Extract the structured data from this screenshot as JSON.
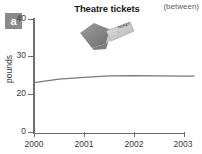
{
  "panel": {
    "letter": "a"
  },
  "header": {
    "title": "Theatre tickets",
    "note": "(between)"
  },
  "illustration": {
    "name": "theatre-tickets-photo",
    "ticket_text": "TICKET"
  },
  "chart_data": {
    "type": "line",
    "title": "Theatre tickets",
    "subtitle": "(between)",
    "xlabel": "",
    "ylabel": "pounds",
    "x": [
      2000,
      2000.5,
      2001,
      2001.5,
      2002,
      2002.5,
      2003,
      2003.2
    ],
    "values": [
      23.0,
      23.9,
      24.4,
      24.75,
      24.8,
      24.75,
      24.7,
      24.7
    ],
    "series": [
      {
        "name": "Theatre tickets",
        "values": [
          23.0,
          23.9,
          24.4,
          24.75,
          24.8,
          24.75,
          24.7,
          24.7
        ]
      }
    ],
    "x_tick_labels": [
      "2000",
      "2001",
      "2002",
      "2003"
    ],
    "x_tick_values": [
      2000,
      2001,
      2002,
      2003
    ],
    "y_tick_labels": [
      "40",
      "30",
      "20",
      "0"
    ],
    "y_tick_values": [
      40,
      30,
      20,
      0
    ],
    "ylim": [
      0,
      40
    ],
    "axis_break": true,
    "grid": false,
    "legend": false,
    "line_color": "#7a7a7a"
  },
  "axes": {
    "y": {
      "label": "pounds",
      "ticks": [
        {
          "label": "40",
          "value": 40
        },
        {
          "label": "30",
          "value": 30
        },
        {
          "label": "20",
          "value": 20
        },
        {
          "label": "0",
          "value": 0
        }
      ]
    },
    "x": {
      "ticks": [
        {
          "label": "2000",
          "value": 2000
        },
        {
          "label": "2001",
          "value": 2001
        },
        {
          "label": "2002",
          "value": 2002
        },
        {
          "label": "2003",
          "value": 2003
        }
      ]
    }
  },
  "colors": {
    "axis": "#6f6f6f",
    "line": "#7a7a7a",
    "badge_bg": "#8a8a8a",
    "text": "#3a3a3a",
    "background": "#ffffff"
  }
}
